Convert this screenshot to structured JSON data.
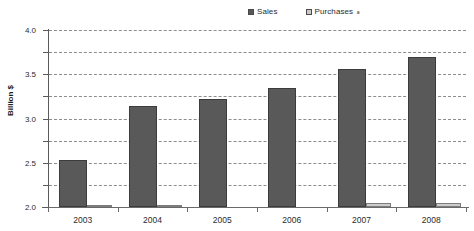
{
  "chart_data": {
    "type": "bar",
    "title": "",
    "xlabel": "",
    "ylabel": "Billion $",
    "ylabel_superscript": "",
    "categories": [
      "2003",
      "2004",
      "2005",
      "2006",
      "2007",
      "2008"
    ],
    "series": [
      {
        "name": "Sales",
        "values": [
          1.07,
          2.29,
          2.43,
          2.69,
          3.11,
          3.38
        ],
        "color": "#595959"
      },
      {
        "name": "Purchases",
        "name_superscript": "a",
        "values": [
          0.03,
          0.02,
          0.0,
          0.0,
          0.09,
          0.1
        ],
        "color": "#cccccc"
      }
    ],
    "ylim": [
      0.0,
      4.0
    ],
    "ytick_values": [
      0.0,
      0.5,
      1.0,
      1.5,
      2.0,
      2.5,
      3.0,
      3.5,
      4.0
    ],
    "ytick_labels": [
      "0.0",
      "0.5",
      "1.0",
      "1.5",
      "2.0",
      "2.5",
      "3.0",
      "3.5",
      "4.0"
    ],
    "grid": true,
    "grid_style": "dashed",
    "legend_position": "top-center",
    "background_color": "#ffffff"
  },
  "legend": {
    "entries": [
      {
        "label": "Sales",
        "superscript": ""
      },
      {
        "label": "Purchases",
        "superscript": "a"
      }
    ]
  }
}
